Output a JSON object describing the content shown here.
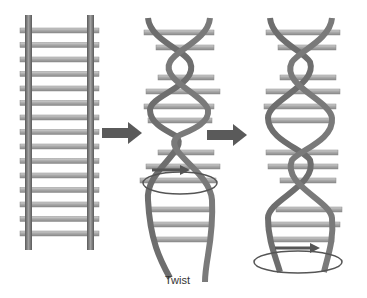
{
  "figure": {
    "caption": "Twist",
    "panels": [
      {
        "name": "straight-ladder",
        "description": "untwisted ladder"
      },
      {
        "name": "partially-twisted-ladder",
        "description": "ladder twisted with rotation arrow"
      },
      {
        "name": "double-helix",
        "description": "fully twisted double helix with rotation arrow"
      }
    ],
    "arrows": [
      "arrow-1",
      "arrow-2"
    ],
    "colors": {
      "rail": "#6e6e6e",
      "rail_highlight": "#9a9a9a",
      "rung": "#b4b4b4",
      "rung_edge": "#8a8a8a",
      "arrow": "#5a5a5a"
    }
  }
}
